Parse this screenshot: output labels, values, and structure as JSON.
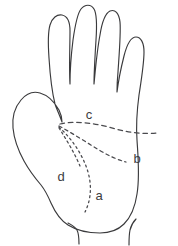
{
  "figure": {
    "background_color": "#ffffff",
    "outline_color": "#3a3a3c",
    "crease_color": "#4a4a4e",
    "label_color": "#3c3c3e"
  },
  "labels": [
    {
      "id": "a",
      "text": "a",
      "x": 99,
      "y": 197
    },
    {
      "id": "b",
      "text": "b",
      "x": 137,
      "y": 160
    },
    {
      "id": "c",
      "text": "c",
      "x": 89,
      "y": 116
    },
    {
      "id": "d",
      "text": "d",
      "x": 61,
      "y": 178
    }
  ],
  "creases": [
    {
      "id": "a",
      "style": "dotted",
      "label": "a"
    },
    {
      "id": "b",
      "style": "dashed",
      "label": "b"
    },
    {
      "id": "c",
      "style": "dashed",
      "label": "c"
    },
    {
      "id": "d",
      "style": "dotted",
      "label": "d"
    }
  ]
}
